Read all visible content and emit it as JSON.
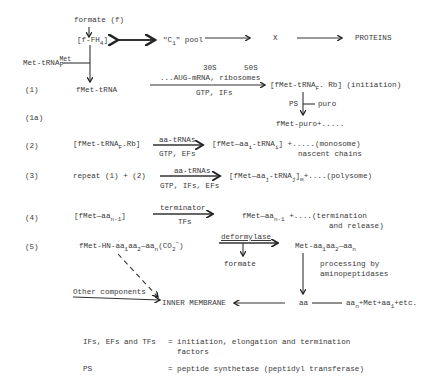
{
  "diagram": {
    "top": {
      "formate": "formate (f)",
      "f_fh4_a": "[f-FH",
      "f_fh4_sub": "4",
      "f_fh4_b": "]",
      "c1_a": "\"C",
      "c1_sub": "1",
      "c1_b": "\" pool",
      "x": "X",
      "proteins": "PROTEINS",
      "met_trna_a": "Met-tRNA",
      "met_trna_sup": "Met",
      "met_trna_sub": "F"
    },
    "step1": {
      "label": "(1)",
      "fmet_trna": "fMet-tRNA",
      "above_1": "30S      50S",
      "above_2": "...AUG-mRNA, ribosomes",
      "below": "GTP, IFs",
      "product_a": "[fMet-tRNA",
      "product_sub": "F",
      "product_b": ". Rb] (initiation)"
    },
    "step1a": {
      "label": "(1a)",
      "ps": "PS",
      "puro": "puro",
      "product": "fMet-puro+....."
    },
    "step2": {
      "label": "(2)",
      "reactant_a": "[fMet-tRNA",
      "reactant_sub": "F",
      "reactant_b": ".Rb]",
      "above": "aa-tRNAs",
      "below": "GTP, EFs",
      "product_a": "[fMet—aa",
      "product_sub1": "i",
      "product_b": "-tRNA",
      "product_sub2": "i",
      "product_c": "] +.....(monosome)",
      "note": "nascent chains"
    },
    "step3": {
      "label": "(3)",
      "reactant": "repeat (1) + (2)",
      "above": "aa-tRNAs",
      "below": "GTP, IFs, EFs",
      "product_a": "[fMet—aa",
      "product_sub1": "j",
      "product_b": "-tRNA",
      "product_sub2": "j",
      "product_c": "]",
      "product_sub3": "m",
      "product_d": "+....(polysome)"
    },
    "step4": {
      "label": "(4)",
      "reactant_a": "[fMet—aa",
      "reactant_sub": "n-1",
      "reactant_b": "]",
      "above": "terminator",
      "below": "TFs",
      "product_a": "fMet—aa",
      "product_sub": "n-1",
      "product_b": " +....(termination",
      "product_c": "and release)"
    },
    "step5": {
      "label": "(5)",
      "reactant_a": "fMet-HN-aa",
      "reactant_sub1": "1",
      "reactant_b": "aa",
      "reactant_sub2": "2",
      "reactant_c": "—aa",
      "reactant_sub3": "n",
      "reactant_d": "(CO",
      "reactant_sub4": "2",
      "reactant_sup": "−",
      "reactant_e": ")",
      "enzyme": "deformylase",
      "formate": "formate",
      "product_a": "Met-aa",
      "product_sub1": "1",
      "product_b": "aa",
      "product_sub2": "2",
      "product_c": "—aa",
      "product_sub3": "n",
      "processing_1": "processing by",
      "processing_2": "aminopeptidases",
      "other": "Other components",
      "membrane": "INNER MEMBRANE",
      "aa": "aa",
      "end_a": "aa",
      "end_sub1": "n",
      "end_b": "+Met+aa",
      "end_sub2": "1",
      "end_c": "+etc."
    },
    "legend": [
      {
        "term": "IFs, EFs and TFs",
        "def": "= initiation, elongation and termination",
        "def2": "factors"
      },
      {
        "term": "PS",
        "def": "= peptide synthetase (peptidyl transferase)"
      }
    ]
  }
}
